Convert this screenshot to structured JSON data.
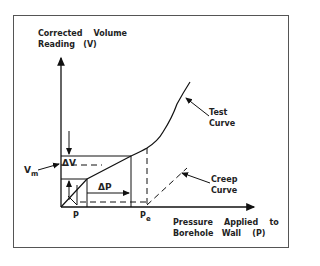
{
  "diagram": {
    "y_axis_label_line1": "Corrected    Volume",
    "y_axis_label_line2": "Reading   (V)",
    "x_axis_label_line1": "Pressure    Applied    to",
    "x_axis_label_line2": "Borehole   Wall    (P)",
    "test_curve_label_line1": "Test",
    "test_curve_label_line2": "Curve",
    "creep_curve_label_line1": "Creep",
    "creep_curve_label_line2": "Curve",
    "vm_label": "V",
    "vm_subscript": "m",
    "delta_v_label": "ΔV",
    "delta_p_label": "ΔP",
    "p_tick_label": "P",
    "pe_tick_label": "P",
    "pe_subscript": "e"
  },
  "colors": {
    "line": "#111111",
    "frame": "#555555",
    "background": "#ffffff"
  }
}
